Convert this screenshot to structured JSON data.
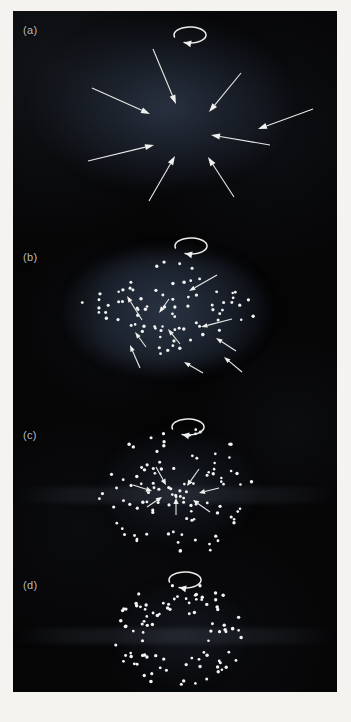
{
  "figure": {
    "kind": "four-panel-photographic-plate",
    "background_color": "#f4f3f0",
    "plate_color": "#050506",
    "ink_color": "#f1f2ef",
    "panel_count": 4
  },
  "panels": [
    {
      "id": "a",
      "label": "(a)",
      "stage_description": "diffuse rotating cloud with strong radial inflow",
      "spin_indicator": "counterclockwise-rotation-arrow",
      "arrow_count": 8,
      "dot_count": 0,
      "cloud_shape": "broad diffuse ellipse",
      "convergence_center": [
        150,
        120
      ]
    },
    {
      "id": "b",
      "label": "(b)",
      "stage_description": "lens-shaped cloud of condensed particles with infall arrows",
      "spin_indicator": "counterclockwise-rotation-arrow",
      "arrow_count": 10,
      "dot_count": 78,
      "cloud_shape": "lens / flattened diamond",
      "convergence_center": [
        155,
        105
      ]
    },
    {
      "id": "c",
      "label": "(c)",
      "stage_description": "dense rotating disk with short residual infall arrows",
      "spin_indicator": "counterclockwise-rotation-arrow",
      "arrow_count": 7,
      "dot_count": 104,
      "cloud_shape": "circular disk",
      "convergence_center": [
        160,
        98
      ]
    },
    {
      "id": "d",
      "label": "(d)",
      "stage_description": "settled rotating ring / annulus, infall complete",
      "spin_indicator": "counterclockwise-rotation-arrow",
      "arrow_count": 0,
      "dot_count": 92,
      "cloud_shape": "annulus with hollow centre",
      "convergence_center": [
        166,
        78
      ]
    }
  ],
  "spin_arrow": {
    "name": "rotation-arrow",
    "direction": "counterclockwise",
    "rx": 16,
    "ry": 8
  },
  "chart_data": {
    "type": "scatter",
    "title": "",
    "xlabel": "",
    "ylabel": "",
    "panels": [
      {
        "name": "(a)",
        "spin_arrow": {
          "cx": 177,
          "cy": 24
        },
        "dots": [],
        "arrows": [
          {
            "x1": 140,
            "y1": 38,
            "x2": 163,
            "y2": 93
          },
          {
            "x1": 228,
            "y1": 62,
            "x2": 196,
            "y2": 101
          },
          {
            "x1": 79,
            "y1": 77,
            "x2": 137,
            "y2": 103
          },
          {
            "x1": 257,
            "y1": 134,
            "x2": 198,
            "y2": 124
          },
          {
            "x1": 75,
            "y1": 150,
            "x2": 141,
            "y2": 134
          },
          {
            "x1": 136,
            "y1": 190,
            "x2": 162,
            "y2": 145
          },
          {
            "x1": 221,
            "y1": 186,
            "x2": 195,
            "y2": 146
          },
          {
            "x1": 300,
            "y1": 98,
            "x2": 245,
            "y2": 118
          }
        ]
      },
      {
        "name": "(b)",
        "spin_arrow": {
          "cx": 178,
          "cy": 45
        },
        "dot_profile": "lens-shaped cluster, semi-major 98, semi-minor 58, centered (157,107)",
        "arrows": [
          {
            "x1": 204,
            "y1": 74,
            "x2": 176,
            "y2": 90
          },
          {
            "x1": 156,
            "y1": 98,
            "x2": 146,
            "y2": 112
          },
          {
            "x1": 129,
            "y1": 119,
            "x2": 114,
            "y2": 95
          },
          {
            "x1": 219,
            "y1": 118,
            "x2": 188,
            "y2": 126
          },
          {
            "x1": 133,
            "y1": 146,
            "x2": 122,
            "y2": 131
          },
          {
            "x1": 167,
            "y1": 143,
            "x2": 155,
            "y2": 128
          },
          {
            "x1": 223,
            "y1": 150,
            "x2": 203,
            "y2": 137
          },
          {
            "x1": 127,
            "y1": 167,
            "x2": 117,
            "y2": 144
          },
          {
            "x1": 190,
            "y1": 172,
            "x2": 171,
            "y2": 161
          },
          {
            "x1": 229,
            "y1": 171,
            "x2": 211,
            "y2": 156
          }
        ]
      },
      {
        "name": "(c)",
        "spin_arrow": {
          "cx": 175,
          "cy": 36
        },
        "dot_profile": "circular disk, radius 78, centered (163,100), denser core",
        "arrows": [
          {
            "x1": 143,
            "y1": 76,
            "x2": 153,
            "y2": 94
          },
          {
            "x1": 186,
            "y1": 78,
            "x2": 174,
            "y2": 95
          },
          {
            "x1": 120,
            "y1": 94,
            "x2": 139,
            "y2": 100
          },
          {
            "x1": 206,
            "y1": 97,
            "x2": 186,
            "y2": 102
          },
          {
            "x1": 134,
            "y1": 116,
            "x2": 149,
            "y2": 106
          },
          {
            "x1": 163,
            "y1": 124,
            "x2": 163,
            "y2": 107
          },
          {
            "x1": 197,
            "y1": 121,
            "x2": 180,
            "y2": 109
          }
        ]
      },
      {
        "name": "(d)",
        "spin_arrow": {
          "cx": 172,
          "cy": 24
        },
        "dot_profile": "annulus, outer radius 66, inner radius 28, centered (166,78)",
        "arrows": []
      }
    ]
  }
}
